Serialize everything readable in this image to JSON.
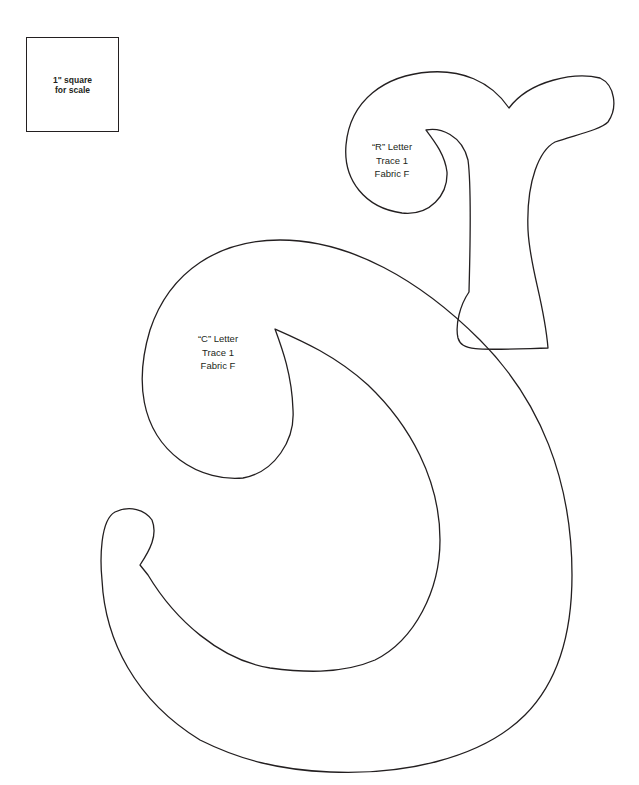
{
  "scale_square": {
    "line1": "1\" square",
    "line2": "for scale"
  },
  "shapes": [
    {
      "name": "R letter",
      "label": [
        "“R” Letter",
        "Trace 1",
        "Fabric F"
      ]
    },
    {
      "name": "C letter",
      "label": [
        "“C” Letter",
        "Trace 1",
        "Fabric F"
      ]
    }
  ],
  "colors": {
    "outline": "#231f20",
    "background": "#ffffff"
  }
}
